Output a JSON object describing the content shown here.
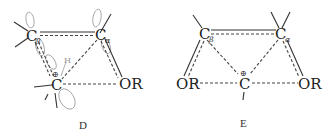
{
  "diagrams": [
    {
      "id": "D",
      "caption": "D",
      "atoms": {
        "c_beta": {
          "symbol": "C",
          "subscript": "β"
        },
        "c_alpha": {
          "symbol": "C",
          "subscript": "α"
        },
        "c_cation": {
          "symbol": "C",
          "charge": "⊕"
        },
        "or": {
          "symbol": "OR"
        },
        "h": {
          "symbol": "H"
        }
      }
    },
    {
      "id": "E",
      "caption": "E",
      "atoms": {
        "c_beta": {
          "symbol": "C",
          "subscript": "β"
        },
        "c_alpha": {
          "symbol": "C",
          "subscript": "α"
        },
        "c_cation": {
          "symbol": "C",
          "charge": "⊕"
        },
        "or_left": {
          "symbol": "OR"
        },
        "or_right": {
          "symbol": "OR"
        }
      }
    }
  ]
}
